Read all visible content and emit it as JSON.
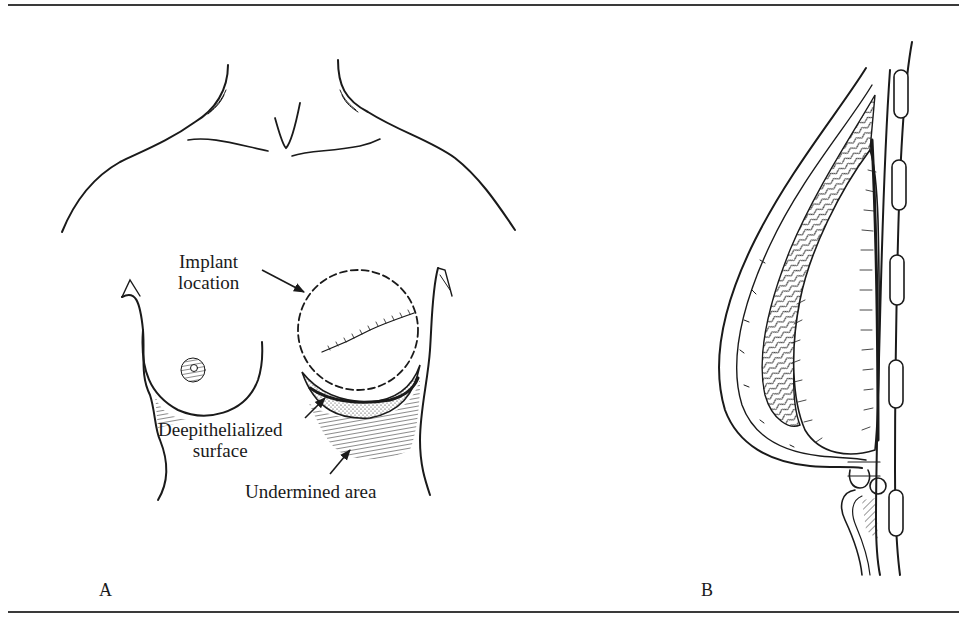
{
  "figure": {
    "panels": [
      {
        "letter": "A",
        "view": "frontal view of chest",
        "labels": {
          "implant_location_line1": "Implant",
          "implant_location_line2": "location",
          "deepithelialized_line1": "Deepithelialized",
          "deepithelialized_line2": "surface",
          "undermined_area": "Undermined area"
        }
      },
      {
        "letter": "B",
        "view": "sagittal cross-section with implant"
      }
    ],
    "colors": {
      "ink": "#1a1a1a",
      "rule": "#3a3a3a",
      "background": "#ffffff"
    }
  }
}
